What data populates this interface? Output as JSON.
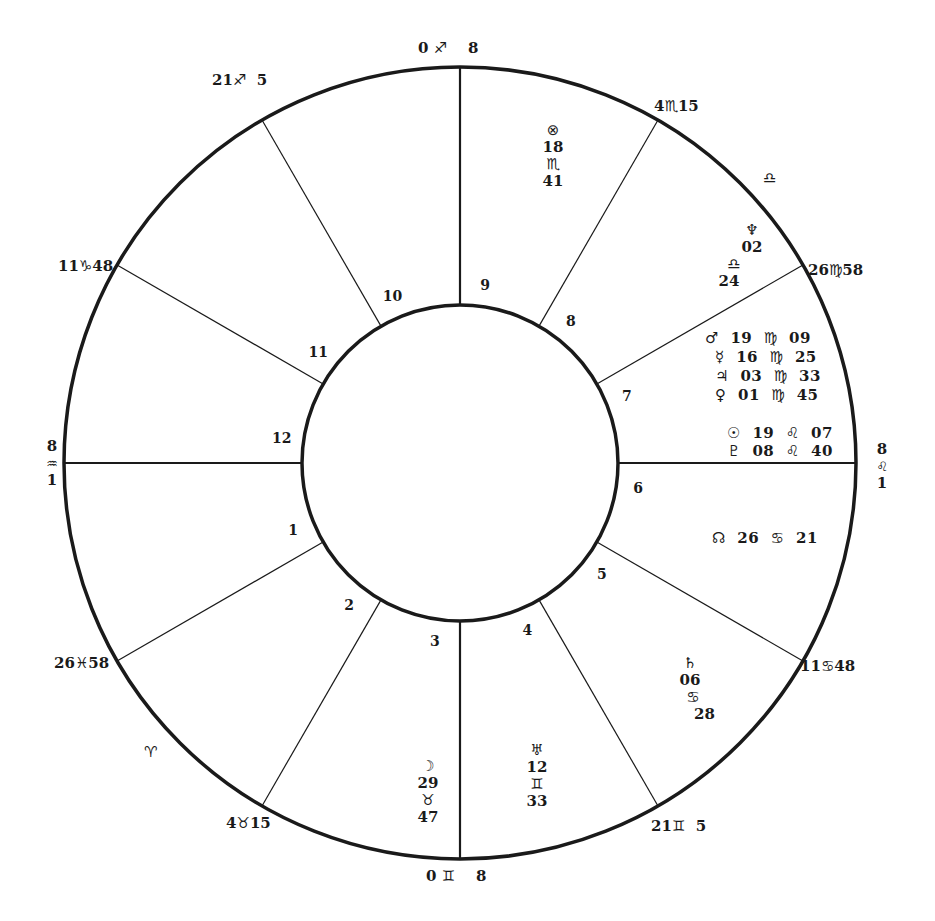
{
  "chart": {
    "type": "natal-wheel",
    "center": [
      460,
      463
    ],
    "outer_radius": 396,
    "inner_radius": 158,
    "line_color": "#1a1a1a"
  },
  "cusps": [
    {
      "id": "mc",
      "deg": "0",
      "sign": "♐",
      "min": "8",
      "x": 418,
      "y": 40
    },
    {
      "id": "c11",
      "deg": "21",
      "sign": "♐",
      "min": "5",
      "x": 212,
      "y": 72
    },
    {
      "id": "c12",
      "deg": "11",
      "sign": "♑",
      "min": "48",
      "x": 58,
      "y": 258
    },
    {
      "id": "c8",
      "deg": "4",
      "sign": "♏",
      "min": "15",
      "x": 654,
      "y": 98
    },
    {
      "id": "c9",
      "deg": "26",
      "sign": "♍",
      "min": "58",
      "x": 808,
      "y": 262
    },
    {
      "id": "c5",
      "deg": "11",
      "sign": "♋",
      "min": "48",
      "x": 800,
      "y": 658
    },
    {
      "id": "c4r",
      "deg": "21",
      "sign": "♊",
      "min": "5",
      "x": 651,
      "y": 818
    },
    {
      "id": "ic",
      "deg": "0",
      "sign": "♊",
      "min": "8",
      "x": 426,
      "y": 868
    },
    {
      "id": "c3",
      "deg": "4",
      "sign": "♉",
      "min": "15",
      "x": 226,
      "y": 815
    },
    {
      "id": "c2",
      "deg": "26",
      "sign": "♓",
      "min": "58",
      "x": 54,
      "y": 655
    }
  ],
  "asc": {
    "deg": "8",
    "sign": "♒",
    "min": "1"
  },
  "dsc": {
    "deg": "8",
    "sign": "♌",
    "min": "1"
  },
  "intercepted": [
    {
      "sign": "♎",
      "x": 763,
      "y": 170
    },
    {
      "sign": "♈",
      "x": 144,
      "y": 744
    }
  ],
  "house_numbers": [
    "1",
    "2",
    "3",
    "4",
    "5",
    "6",
    "7",
    "8",
    "9",
    "10",
    "11",
    "12"
  ],
  "planets_stacked": [
    {
      "name": "part-of-fortune",
      "glyph": "⊗",
      "deg": "18",
      "sign": "♏",
      "min": "41",
      "x": 553,
      "y": 122
    },
    {
      "name": "neptune",
      "glyph": "♆",
      "deg": "02",
      "sign": "♎",
      "min": "24",
      "x": 752,
      "y": 222
    },
    {
      "name": "saturn",
      "glyph": "♄",
      "deg": "06",
      "sign": "♋",
      "min": "28",
      "x": 690,
      "y": 655
    },
    {
      "name": "uranus",
      "glyph": "♅",
      "deg": "12",
      "sign": "♊",
      "min": "33",
      "x": 537,
      "y": 742
    },
    {
      "name": "moon",
      "glyph": "☽",
      "deg": "29",
      "sign": "♉",
      "min": "47",
      "x": 428,
      "y": 758
    }
  ],
  "planets_rows": [
    {
      "name": "mars",
      "glyph": "♂",
      "deg": "19",
      "sign": "♍",
      "min": "09",
      "x": 705,
      "y": 330
    },
    {
      "name": "mercury",
      "glyph": "☿",
      "deg": "16",
      "sign": "♍",
      "min": "25",
      "x": 715,
      "y": 349
    },
    {
      "name": "jupiter",
      "glyph": "♃",
      "deg": "03",
      "sign": "♍",
      "min": "33",
      "x": 715,
      "y": 368
    },
    {
      "name": "venus",
      "glyph": "♀",
      "deg": "01",
      "sign": "♍",
      "min": "45",
      "x": 715,
      "y": 387
    },
    {
      "name": "sun",
      "glyph": "☉",
      "deg": "19",
      "sign": "♌",
      "min": "07",
      "x": 727,
      "y": 425
    },
    {
      "name": "pluto",
      "glyph": "♇",
      "deg": "08",
      "sign": "♌",
      "min": "40",
      "x": 727,
      "y": 443
    },
    {
      "name": "north-node",
      "glyph": "☊",
      "deg": "26",
      "sign": "♋",
      "min": "21",
      "x": 712,
      "y": 530
    }
  ]
}
